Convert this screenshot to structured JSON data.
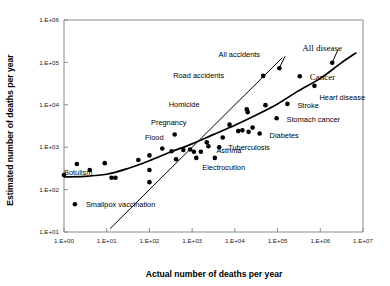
{
  "chart_data": {
    "type": "scatter",
    "title": "",
    "xlabel": "Actual number of deaths per year",
    "ylabel": "Estimated number of deaths per year",
    "xscale": "log",
    "yscale": "log",
    "xlim": [
      1,
      10000000
    ],
    "ylim": [
      10,
      1000000
    ],
    "grid": false,
    "legend": false,
    "xtick_labels": [
      "1.E+00",
      "1.E+01",
      "1.E+02",
      "1.E+03",
      "1.E+04",
      "1.E+05",
      "1.E+06",
      "1.E+07"
    ],
    "ytick_labels": [
      "1.E+01",
      "1.E+02",
      "1.E+03",
      "1.E+04",
      "1.E+05",
      "1.E+06"
    ],
    "xticks": [
      1,
      10,
      100,
      1000,
      10000,
      100000,
      1000000,
      10000000
    ],
    "yticks": [
      10,
      100,
      1000,
      10000,
      100000,
      1000000
    ],
    "points": [
      {
        "label": "Smallpox vaccination",
        "x": 1.8,
        "y": 45,
        "label_dx": 11,
        "label_dy": 2.5,
        "label_anchor": "start"
      },
      {
        "label": "Botulism",
        "x": 1.0,
        "y": 220,
        "label_dx": 0,
        "label_dy": 0,
        "label_anchor": "start"
      },
      {
        "label": "",
        "x": 2.0,
        "y": 400,
        "label_dx": 0,
        "label_dy": 0,
        "label_anchor": "start"
      },
      {
        "label": "",
        "x": 4.0,
        "y": 290,
        "label_dx": 0,
        "label_dy": 0,
        "label_anchor": "start"
      },
      {
        "label": "",
        "x": 9.0,
        "y": 420,
        "label_dx": 0,
        "label_dy": 0,
        "label_anchor": "start"
      },
      {
        "label": "",
        "x": 13.0,
        "y": 190,
        "label_dx": 0,
        "label_dy": 0,
        "label_anchor": "start"
      },
      {
        "label": "",
        "x": 16.0,
        "y": 190,
        "label_dx": 0,
        "label_dy": 0,
        "label_anchor": "start"
      },
      {
        "label": "",
        "x": 55.0,
        "y": 500,
        "label_dx": 0,
        "label_dy": 0,
        "label_anchor": "start"
      },
      {
        "label": "",
        "x": 100.0,
        "y": 640,
        "label_dx": 0,
        "label_dy": 0,
        "label_anchor": "start"
      },
      {
        "label": "",
        "x": 100.0,
        "y": 290,
        "label_dx": 0,
        "label_dy": 0,
        "label_anchor": "start"
      },
      {
        "label": "",
        "x": 100.0,
        "y": 150,
        "label_dx": 0,
        "label_dy": 0,
        "label_anchor": "start"
      },
      {
        "label": "Flood",
        "x": 200.0,
        "y": 930,
        "label_dx": -8,
        "label_dy": -9,
        "label_anchor": "middle"
      },
      {
        "label": "Pregnancy",
        "x": 390.0,
        "y": 2000,
        "label_dx": -6,
        "label_dy": -9,
        "label_anchor": "middle"
      },
      {
        "label": "",
        "x": 330.0,
        "y": 800,
        "label_dx": 0,
        "label_dy": 0,
        "label_anchor": "start"
      },
      {
        "label": "",
        "x": 420.0,
        "y": 520,
        "label_dx": 0,
        "label_dy": 0,
        "label_anchor": "start"
      },
      {
        "label": "",
        "x": 620.0,
        "y": 860,
        "label_dx": 0,
        "label_dy": 0,
        "label_anchor": "start"
      },
      {
        "label": "",
        "x": 900.0,
        "y": 880,
        "label_dx": 0,
        "label_dy": 0,
        "label_anchor": "start"
      },
      {
        "label": "",
        "x": 1100.0,
        "y": 780,
        "label_dx": 0,
        "label_dy": 0,
        "label_anchor": "start"
      },
      {
        "label": "Electrocution",
        "x": 1250.0,
        "y": 560,
        "label_dx": 6,
        "label_dy": 12,
        "label_anchor": "start"
      },
      {
        "label": "",
        "x": 1600.0,
        "y": 780,
        "label_dx": 0,
        "label_dy": 0,
        "label_anchor": "start"
      },
      {
        "label": "",
        "x": 2200.0,
        "y": 1300,
        "label_dx": 0,
        "label_dy": 0,
        "label_anchor": "start"
      },
      {
        "label": "Asthma",
        "x": 2400.0,
        "y": 1050,
        "label_dx": 8,
        "label_dy": 7,
        "label_anchor": "start"
      },
      {
        "label": "",
        "x": 3400.0,
        "y": 560,
        "label_dx": 0,
        "label_dy": 0,
        "label_anchor": "start"
      },
      {
        "label": "Tuberculosis",
        "x": 4300.0,
        "y": 1000,
        "label_dx": 9,
        "label_dy": 3,
        "label_anchor": "start"
      },
      {
        "label": "",
        "x": 5200.0,
        "y": 1700,
        "label_dx": 0,
        "label_dy": 0,
        "label_anchor": "start"
      },
      {
        "label": "",
        "x": 7500.0,
        "y": 3400,
        "label_dx": 0,
        "label_dy": 0,
        "label_anchor": "start"
      },
      {
        "label": "",
        "x": 12000.0,
        "y": 2400,
        "label_dx": 0,
        "label_dy": 0,
        "label_anchor": "start"
      },
      {
        "label": "",
        "x": 15000.0,
        "y": 2500,
        "label_dx": 0,
        "label_dy": 0,
        "label_anchor": "start"
      },
      {
        "label": "Homicide",
        "x": 19000.0,
        "y": 7800,
        "label_dx": -78,
        "label_dy": -2,
        "label_anchor": "start"
      },
      {
        "label": "",
        "x": 20000.0,
        "y": 6700,
        "label_dx": 0,
        "label_dy": 0,
        "label_anchor": "start"
      },
      {
        "label": "",
        "x": 21000.0,
        "y": 2300,
        "label_dx": 0,
        "label_dy": 0,
        "label_anchor": "start"
      },
      {
        "label": "",
        "x": 26000.0,
        "y": 2900,
        "label_dx": 0,
        "label_dy": 0,
        "label_anchor": "start"
      },
      {
        "label": "Diabetes",
        "x": 38000.0,
        "y": 2100,
        "label_dx": 10,
        "label_dy": 4,
        "label_anchor": "start"
      },
      {
        "label": "Road accidents",
        "x": 46000.0,
        "y": 48000,
        "label_dx": -90,
        "label_dy": 2,
        "label_anchor": "start"
      },
      {
        "label": "",
        "x": 52000.0,
        "y": 9800,
        "label_dx": 0,
        "label_dy": 0,
        "label_anchor": "start"
      },
      {
        "label": "All accidents",
        "x": 110000.0,
        "y": 73000,
        "label_dx": -40,
        "label_dy": -11,
        "label_anchor": "middle"
      },
      {
        "label": "Stroke",
        "x": 170000.0,
        "y": 10500,
        "label_dx": 10,
        "label_dy": 4,
        "label_anchor": "start"
      },
      {
        "label": "Stomach cancer",
        "x": 95000.0,
        "y": 4800,
        "label_dx": 10,
        "label_dy": 4,
        "label_anchor": "start"
      },
      {
        "label": "Cancer",
        "x": 330000.0,
        "y": 47000,
        "label_dx": 10,
        "label_dy": 4,
        "label_anchor": "start"
      },
      {
        "label": "Heart disease",
        "x": 730000.0,
        "y": 28000,
        "label_dx": 5,
        "label_dy": 14,
        "label_anchor": "start"
      },
      {
        "label": "All disease",
        "x": 1900000.0,
        "y": 98000,
        "label_dx": -10,
        "label_dy": -12,
        "label_anchor": "middle"
      }
    ],
    "fit_curve": {
      "name": "fitted regression curve",
      "points": [
        [
          1,
          200
        ],
        [
          3,
          205
        ],
        [
          10,
          230
        ],
        [
          30,
          310
        ],
        [
          100,
          480
        ],
        [
          300,
          760
        ],
        [
          1000,
          1200
        ],
        [
          3000,
          1950
        ],
        [
          10000,
          3300
        ],
        [
          30000,
          5600
        ],
        [
          100000,
          10500
        ],
        [
          300000,
          21000
        ],
        [
          1000000,
          42000
        ],
        [
          3000000,
          95000
        ],
        [
          7000000,
          170000
        ]
      ]
    },
    "identity_line": {
      "name": "1:1 identity line",
      "from": [
        12,
        12
      ],
      "to": [
        130000,
        130000
      ]
    },
    "leader_lines": [
      {
        "name": "all-accidents-leader",
        "from_x": 110000,
        "from_y": 73000,
        "to_x": 150000,
        "to_y": 140000
      },
      {
        "name": "all-disease-leader",
        "from_x": 1900000,
        "from_y": 98000,
        "to_x": 2600000,
        "to_y": 200000
      }
    ]
  }
}
